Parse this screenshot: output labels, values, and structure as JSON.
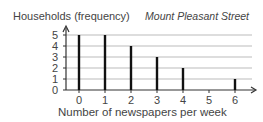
{
  "chart_data": {
    "type": "bar",
    "title": "Mount Pleasant Street",
    "xlabel": "Number of newspapers per week",
    "ylabel": "Households (frequency)",
    "categories": [
      "0",
      "1",
      "2",
      "3",
      "4",
      "5",
      "6"
    ],
    "values": [
      5,
      5,
      4,
      3,
      2,
      0,
      1
    ],
    "y_ticks": [
      "0",
      "1",
      "2",
      "3",
      "4",
      "5"
    ],
    "ylim": [
      0,
      5
    ],
    "grid": true,
    "bar_style": "line-plot (thin vertical bars)"
  }
}
